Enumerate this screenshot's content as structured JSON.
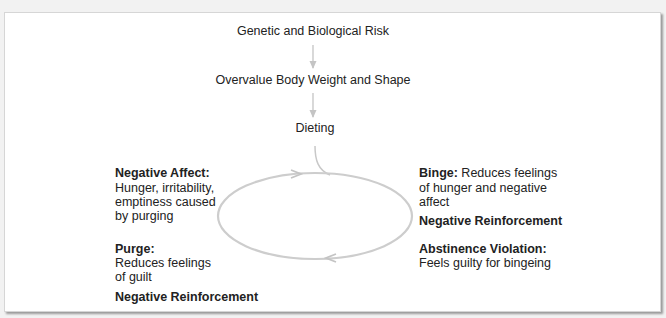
{
  "page": {
    "cutoff_text": "",
    "colors": {
      "background": "#f2f2f2",
      "panel": "#ffffff",
      "text": "#222222",
      "arrow": "#c4c4c4"
    }
  },
  "diagram": {
    "chain": [
      {
        "label": "Genetic and Biological Risk"
      },
      {
        "label": "Overvalue Body Weight and Shape"
      },
      {
        "label": "Dieting"
      }
    ],
    "cycle": {
      "negative_affect": {
        "title": "Negative Affect:",
        "lines": [
          "Hunger, irritability,",
          "emptiness caused",
          "by purging"
        ]
      },
      "purge": {
        "title": "Purge:",
        "lines": [
          "Reduces feelings",
          "of guilt"
        ],
        "reinforcement": "Negative Reinforcement"
      },
      "binge": {
        "title": "Binge:",
        "first_line_rest": " Reduces feelings",
        "lines": [
          "of hunger and negative",
          "affect"
        ],
        "reinforcement": "Negative Reinforcement"
      },
      "abstinence_violation": {
        "title": "Abstinence Violation:",
        "lines": [
          "Feels guilty for bingeing"
        ]
      }
    }
  }
}
